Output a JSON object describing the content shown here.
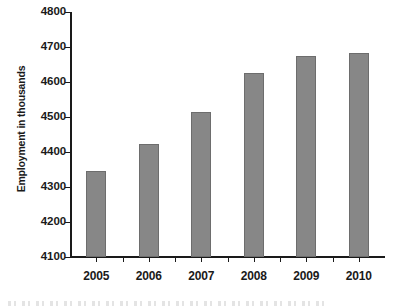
{
  "chart_data": {
    "type": "bar",
    "title": "",
    "xlabel": "",
    "ylabel": "Employment in thousands",
    "categories": [
      "2005",
      "2006",
      "2007",
      "2008",
      "2009",
      "2010"
    ],
    "values": [
      4345,
      4422,
      4513,
      4627,
      4675,
      4683
    ],
    "series": [
      {
        "name": "Employment",
        "values": [
          4345,
          4422,
          4513,
          4627,
          4675,
          4683
        ]
      }
    ],
    "ylim": [
      4100,
      4800
    ],
    "yticks": [
      4100,
      4200,
      4300,
      4400,
      4500,
      4600,
      4700,
      4800
    ],
    "ytick_labels": [
      "4100",
      "4200",
      "4300",
      "4400",
      "4500",
      "4600",
      "4700",
      "4800"
    ],
    "grid": false,
    "legend": false,
    "legend_position": "none",
    "bar_color": "#878787",
    "bar_border_color": "#6d6d6d",
    "axis_color": "#1a1a1a",
    "background_color": "#ffffff"
  }
}
